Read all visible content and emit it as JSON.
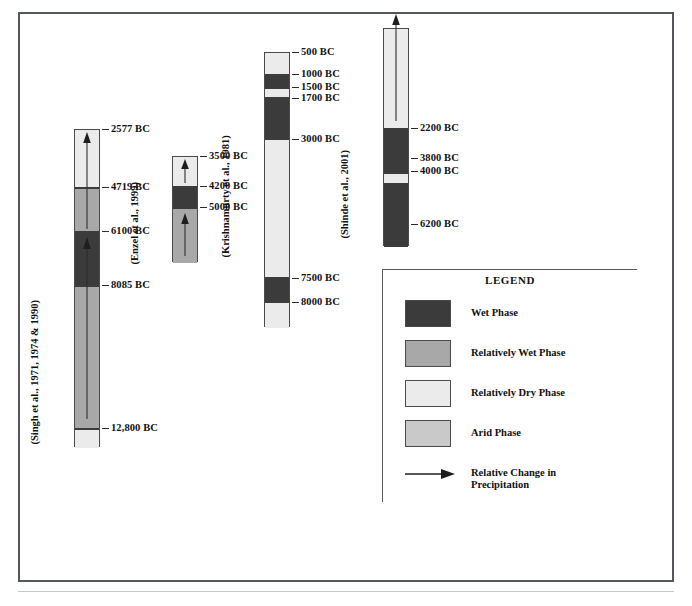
{
  "figure": {
    "caption": "",
    "background_color": "#ffffff",
    "frame_color": "#53565a"
  },
  "palette": {
    "wet": "#3b3b3b",
    "relatively_wet": "#a8a8a8",
    "relatively_dry": "#ebebeb",
    "arid": "#c9c9c9",
    "outline": "#4a4a4a",
    "text": "#111111"
  },
  "columns": [
    {
      "id": "singh",
      "source_label": "(Singh et al., 1971, 1974 & 1990)",
      "segments": [
        {
          "phase": "Relatively Dry Phase",
          "color_key": "relatively_dry",
          "top_label": "2577 BC",
          "bottom_label": "4719 BC"
        },
        {
          "phase": "Relatively Wet Phase",
          "color_key": "relatively_wet",
          "top_label": "4719 BC",
          "bottom_label": "6100 BC"
        },
        {
          "phase": "Wet Phase",
          "color_key": "wet",
          "top_label": "6100 BC",
          "bottom_label": "8085 BC"
        },
        {
          "phase": "Relatively Wet Phase",
          "color_key": "relatively_wet",
          "top_label": "8085 BC",
          "bottom_label": "12,800 BC"
        },
        {
          "phase": "Relatively Dry Phase",
          "color_key": "relatively_dry",
          "top_label": "12,800 BC",
          "bottom_label": ""
        }
      ],
      "ticks": [
        "2577 BC",
        "4719 BC",
        "6100 BC",
        "8085 BC",
        "12,800 BC"
      ],
      "arrows": 2
    },
    {
      "id": "enzel",
      "source_label": "(Enzel et al., 1999)",
      "segments": [
        {
          "phase": "Relatively Dry Phase",
          "color_key": "relatively_dry",
          "top_label": "3500 BC",
          "bottom_label": "4200 BC"
        },
        {
          "phase": "Wet Phase",
          "color_key": "wet",
          "top_label": "4200 BC",
          "bottom_label": "5000 BC"
        },
        {
          "phase": "Relatively Wet Phase",
          "color_key": "relatively_wet",
          "top_label": "5000 BC",
          "bottom_label": ""
        }
      ],
      "ticks": [
        "3500 BC",
        "4200 BC",
        "5000 BC"
      ],
      "arrows": 2
    },
    {
      "id": "krishnamurty",
      "source_label": "(Krishnamurty et al., 1981)",
      "segments": [
        {
          "phase": "Relatively Dry Phase",
          "color_key": "relatively_dry",
          "top_label": "500 BC",
          "bottom_label": "1000 BC"
        },
        {
          "phase": "Wet Phase",
          "color_key": "wet",
          "top_label": "1000 BC",
          "bottom_label": "1500 BC"
        },
        {
          "phase": "Relatively Dry Phase",
          "color_key": "relatively_dry",
          "top_label": "1500 BC",
          "bottom_label": "1700 BC"
        },
        {
          "phase": "Wet Phase",
          "color_key": "wet",
          "top_label": "1700 BC",
          "bottom_label": "3000 BC"
        },
        {
          "phase": "Relatively Dry Phase",
          "color_key": "relatively_dry",
          "top_label": "3000 BC",
          "bottom_label": "7500 BC"
        },
        {
          "phase": "Wet Phase",
          "color_key": "wet",
          "top_label": "7500 BC",
          "bottom_label": "8000 BC"
        },
        {
          "phase": "Relatively Dry Phase",
          "color_key": "relatively_dry",
          "top_label": "8000 BC",
          "bottom_label": ""
        }
      ],
      "ticks": [
        "500 BC",
        "1000 BC",
        "1500 BC",
        "1700 BC",
        "3000 BC",
        "7500 BC",
        "8000 BC"
      ],
      "arrows": 0
    },
    {
      "id": "shinde",
      "source_label": "(Shinde et al., 2001)",
      "segments": [
        {
          "phase": "Relatively Dry Phase",
          "color_key": "relatively_dry",
          "top_label": "",
          "bottom_label": "2200 BC"
        },
        {
          "phase": "Wet Phase",
          "color_key": "wet",
          "top_label": "2200 BC",
          "bottom_label": "3800 BC"
        },
        {
          "phase": "Relatively Dry Phase",
          "color_key": "relatively_dry",
          "top_label": "3800 BC",
          "bottom_label": "4000 BC"
        },
        {
          "phase": "Wet Phase",
          "color_key": "wet",
          "top_label": "4000 BC",
          "bottom_label": "6200 BC"
        }
      ],
      "ticks": [
        "2200 BC",
        "3800 BC",
        "4000 BC",
        "6200 BC"
      ],
      "arrows": 1
    }
  ],
  "legend": {
    "title": "LEGEND",
    "items": [
      {
        "label": "Wet Phase",
        "color_key": "wet",
        "type": "swatch"
      },
      {
        "label": "Relatively Wet Phase",
        "color_key": "relatively_wet",
        "type": "swatch"
      },
      {
        "label": "Relatively Dry Phase",
        "color_key": "relatively_dry",
        "type": "swatch"
      },
      {
        "label": "Arid Phase",
        "color_key": "arid",
        "type": "swatch"
      },
      {
        "label": "Relative Change in\nPrecipitation",
        "color_key": "",
        "type": "arrow"
      }
    ]
  }
}
